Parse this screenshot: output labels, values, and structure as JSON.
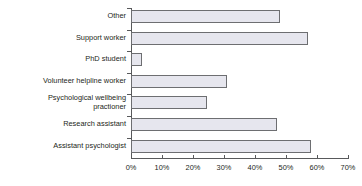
{
  "chart_data": {
    "type": "bar",
    "orientation": "horizontal",
    "title": "",
    "subtitle": "",
    "xlabel": "",
    "ylabel": "",
    "categories": [
      "Other",
      "Support worker",
      "PhD student",
      "Volunteer helpline worker",
      "Psychological wellbeing practioner",
      "Research assistant",
      "Assistant psychologist"
    ],
    "category_lines": [
      [
        "Other"
      ],
      [
        "Support worker"
      ],
      [
        "PhD student"
      ],
      [
        "Volunteer helpline worker"
      ],
      [
        "Psychological wellbeing",
        "practioner"
      ],
      [
        "Research assistant"
      ],
      [
        "Assistant psychologist"
      ]
    ],
    "values": [
      48,
      57,
      3.5,
      31,
      24.5,
      47,
      58
    ],
    "value_unit": "%",
    "xlim": [
      0,
      70
    ],
    "xticks": [
      0,
      10,
      20,
      30,
      40,
      50,
      60,
      70
    ],
    "xtick_labels": [
      "0%",
      "10%",
      "20%",
      "30%",
      "40%",
      "50%",
      "60%",
      "70%"
    ],
    "grid": false,
    "legend": null,
    "legend_position": "none",
    "colors": {
      "bar_fill": "#e6e6ee",
      "bar_border": "#6d6e71",
      "axis": "#58595b",
      "text": "#231f20",
      "background": "#ffffff"
    }
  }
}
